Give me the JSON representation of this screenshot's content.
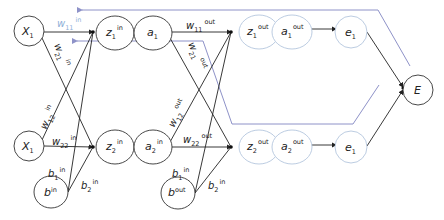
{
  "diagram": {
    "type": "neural-network-backpropagation",
    "colors": {
      "forward_node_stroke": "#333333",
      "output_node_stroke": "#b4c6de",
      "edge": "#222222",
      "backprop_line": "#8e92c8",
      "highlight_label": "#8fb0d8"
    },
    "nodes": {
      "x1_top": {
        "label": "X",
        "sub": "1",
        "sup": ""
      },
      "x1_bottom": {
        "label": "X",
        "sub": "1",
        "sup": ""
      },
      "b_in": {
        "label": "b",
        "sub": "",
        "sup": "in"
      },
      "z1_in": {
        "label": "z",
        "sub": "1",
        "sup": "in"
      },
      "a1": {
        "label": "a",
        "sub": "1",
        "sup": ""
      },
      "z2_in": {
        "label": "z",
        "sub": "2",
        "sup": "in"
      },
      "a2_in": {
        "label": "a",
        "sub": "2",
        "sup": "in"
      },
      "b_out": {
        "label": "b",
        "sub": "",
        "sup": "out"
      },
      "z1_out": {
        "label": "z",
        "sub": "1",
        "sup": "out"
      },
      "a1_out": {
        "label": "a",
        "sub": "1",
        "sup": "out"
      },
      "e1_top": {
        "label": "e",
        "sub": "1",
        "sup": ""
      },
      "z2_out": {
        "label": "z",
        "sub": "2",
        "sup": "out"
      },
      "a2_out": {
        "label": "a",
        "sub": "2",
        "sup": "out"
      },
      "e1_bottom": {
        "label": "e",
        "sub": "1",
        "sup": ""
      },
      "E": {
        "label": "E",
        "sub": "",
        "sup": ""
      }
    },
    "edge_labels": {
      "w11_in": {
        "label": "w",
        "sub": "11",
        "sup": "in"
      },
      "w21_in": {
        "label": "w",
        "sub": "21",
        "sup": "in"
      },
      "w12_in": {
        "label": "w",
        "sub": "12",
        "sup": "in"
      },
      "w22_in": {
        "label": "w",
        "sub": "22",
        "sup": "in"
      },
      "b1_in": {
        "label": "b",
        "sub": "1",
        "sup": "in"
      },
      "b2_in": {
        "label": "b",
        "sub": "2",
        "sup": "in"
      },
      "w11_out": {
        "label": "w",
        "sub": "11",
        "sup": "out"
      },
      "w21_out": {
        "label": "w",
        "sub": "21",
        "sup": "out"
      },
      "w12_out": {
        "label": "w",
        "sub": "12",
        "sup": "out"
      },
      "w22_out": {
        "label": "w",
        "sub": "22",
        "sup": "out"
      },
      "b1_out_label": {
        "label": "b",
        "sub": "1",
        "sup": "in"
      },
      "b2_out_label": {
        "label": "b",
        "sub": "2",
        "sup": "in"
      }
    }
  }
}
